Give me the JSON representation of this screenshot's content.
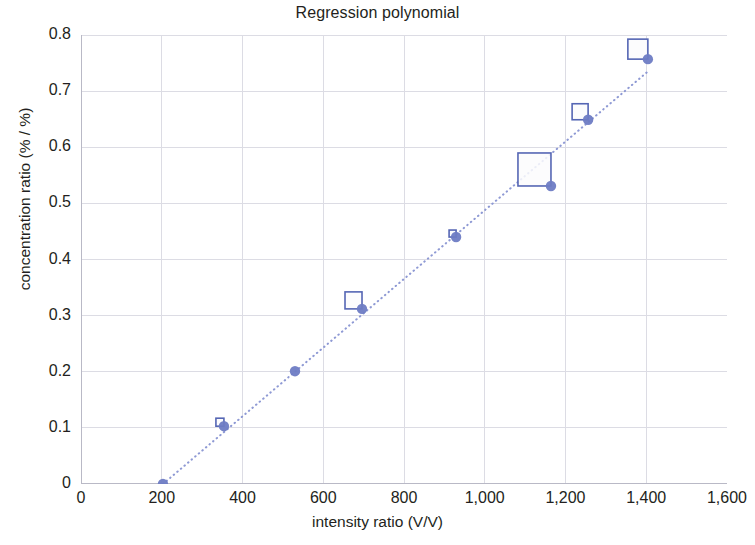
{
  "chart_data": {
    "type": "scatter",
    "title": "Regression polynomial",
    "xlabel": "intensity ratio (V/V)",
    "ylabel": "concentration ratio (% / %)",
    "xlim": [
      0,
      1600
    ],
    "ylim": [
      0,
      0.8
    ],
    "xticks": [
      0,
      200,
      400,
      600,
      800,
      1000,
      1200,
      1400,
      1600
    ],
    "xtick_labels": [
      "0",
      "200",
      "400",
      "600",
      "800",
      "1,000",
      "1,200",
      "1,400",
      "1,600"
    ],
    "yticks": [
      0,
      0.1,
      0.2,
      0.3,
      0.4,
      0.5,
      0.6,
      0.7,
      0.8
    ],
    "ytick_labels": [
      "0",
      "0.1",
      "0.2",
      "0.3",
      "0.4",
      "0.5",
      "0.6",
      "0.7",
      "0.8"
    ],
    "grid": true,
    "legend": null,
    "marker_color": "#6E7CC4",
    "line_color": "#8E99D4",
    "line_style": "dotted",
    "series": [
      {
        "name": "measurements",
        "marker": "circle",
        "x": [
          203,
          354,
          530,
          696,
          929,
          1164,
          1256,
          1404
        ],
        "values": [
          0.0,
          0.103,
          0.201,
          0.312,
          0.44,
          0.531,
          0.649,
          0.757
        ]
      },
      {
        "name": "residual boxes",
        "marker": "open-square",
        "x": [
          203,
          354,
          530,
          696,
          929,
          1164,
          1256,
          1404
        ],
        "values": [
          0.0,
          0.103,
          0.201,
          0.312,
          0.44,
          0.531,
          0.649,
          0.757
        ],
        "box_sizes_px": [
          0,
          8,
          0,
          17,
          7,
          33,
          16,
          20
        ]
      },
      {
        "name": "regression fit",
        "marker": "none",
        "x": [
          203,
          1404
        ],
        "values": [
          0.0,
          0.735
        ]
      }
    ]
  },
  "chart": {
    "title": "Regression polynomial",
    "x_axis_title": "intensity ratio (V/V)",
    "y_axis_title": "concentration ratio (% / %)"
  }
}
